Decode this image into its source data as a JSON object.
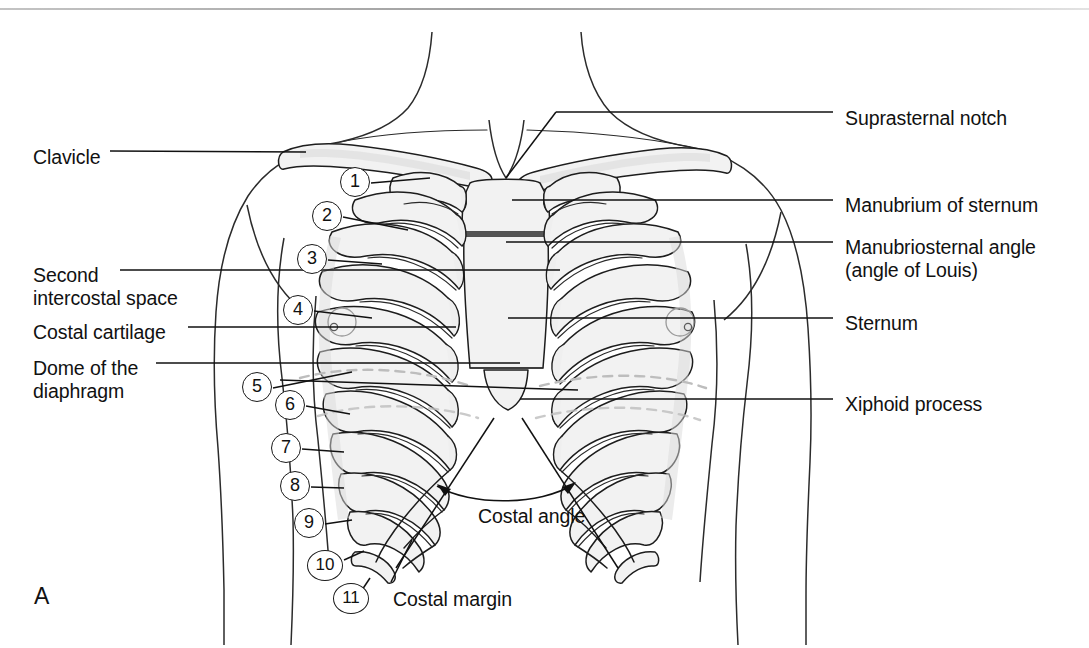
{
  "figure": {
    "panel_letter": "A",
    "title_hidden": "Anterior view of the thorax with rib landmarks"
  },
  "colors": {
    "ink": "#1a1a1a",
    "bone_fill": "#f1f1f1",
    "bone_shade": "#dcdcdc",
    "sternum_fill": "#f0f0f0",
    "background": "#ffffff",
    "top_rule": "#8e8e8e"
  },
  "labels_left": [
    {
      "id": "clavicle",
      "text": "Clavicle",
      "x": 33,
      "y": 146,
      "lines": 1
    },
    {
      "id": "second-intercostal-space",
      "text": "Second\nintercostal space",
      "x": 33,
      "y": 264,
      "lines": 2
    },
    {
      "id": "costal-cartilage",
      "text": "Costal cartilage",
      "x": 33,
      "y": 321,
      "lines": 1
    },
    {
      "id": "dome-of-the-diaphragm",
      "text": "Dome of the\ndiaphragm",
      "x": 33,
      "y": 357,
      "lines": 2
    }
  ],
  "labels_right": [
    {
      "id": "suprasternal-notch",
      "text": "Suprasternal notch",
      "x": 845,
      "y": 107,
      "lines": 1
    },
    {
      "id": "manubrium-of-sternum",
      "text": "Manubrium of sternum",
      "x": 845,
      "y": 194,
      "lines": 1
    },
    {
      "id": "manubriosternal-angle",
      "text": "Manubriosternal angle\n(angle of Louis)",
      "x": 845,
      "y": 236,
      "lines": 2
    },
    {
      "id": "sternum",
      "text": "Sternum",
      "x": 845,
      "y": 312,
      "lines": 1
    },
    {
      "id": "xiphoid-process",
      "text": "Xiphoid process",
      "x": 845,
      "y": 393,
      "lines": 1
    }
  ],
  "labels_inner": [
    {
      "id": "costal-angle",
      "text": "Costal angle",
      "x": 478,
      "y": 505
    },
    {
      "id": "costal-margin",
      "text": "Costal margin",
      "x": 393,
      "y": 588
    }
  ],
  "rib_callouts": [
    {
      "n": "1",
      "cx": 355,
      "cy": 182
    },
    {
      "n": "2",
      "cx": 327,
      "cy": 216
    },
    {
      "n": "3",
      "cx": 312,
      "cy": 259
    },
    {
      "n": "4",
      "cx": 298,
      "cy": 310
    },
    {
      "n": "5",
      "cx": 257,
      "cy": 387
    },
    {
      "n": "6",
      "cx": 290,
      "cy": 405
    },
    {
      "n": "7",
      "cx": 286,
      "cy": 448
    },
    {
      "n": "8",
      "cx": 295,
      "cy": 486
    },
    {
      "n": "9",
      "cx": 309,
      "cy": 523
    },
    {
      "n": "10",
      "cx": 325,
      "cy": 565
    },
    {
      "n": "11",
      "cx": 351,
      "cy": 598
    }
  ],
  "leader_lines_left": [
    {
      "id": "clavicle-leader",
      "x1": 110,
      "y1": 151,
      "x2": 305,
      "y2": 151
    },
    {
      "id": "second-ics-leader",
      "x1": 118,
      "y1": 270,
      "x2": 560,
      "y2": 270
    },
    {
      "id": "costal-cartilage-leader",
      "x1": 186,
      "y1": 327,
      "x2": 455,
      "y2": 327
    },
    {
      "id": "diaphragm-leader",
      "x1": 153,
      "y1": 363,
      "x2": 575,
      "y2": 385
    }
  ],
  "leader_lines_right": [
    {
      "id": "suprasternal-leader",
      "x1": 833,
      "y1": 112,
      "x2": 521,
      "y2": 183
    },
    {
      "id": "manubrium-leader",
      "x1": 833,
      "y1": 200,
      "x2": 512,
      "y2": 200
    },
    {
      "id": "angle-louis-leader",
      "x1": 833,
      "y1": 242,
      "x2": 512,
      "y2": 242
    },
    {
      "id": "sternum-leader",
      "x1": 833,
      "y1": 318,
      "x2": 508,
      "y2": 318
    },
    {
      "id": "xiphoid-leader",
      "x1": 833,
      "y1": 399,
      "x2": 518,
      "y2": 399
    }
  ],
  "costal_angle_arrow": {
    "left_tip_x": 437,
    "left_tip_y": 484,
    "right_tip_x": 574,
    "right_tip_y": 482,
    "sag_y": 498
  },
  "costal_margin_leader": {
    "x1": 400,
    "y1": 580,
    "x2": 408,
    "y2": 550
  }
}
